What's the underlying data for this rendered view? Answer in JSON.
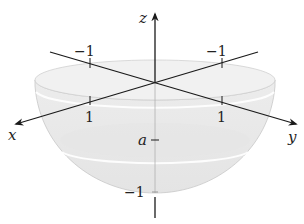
{
  "figure": {
    "type": "3d-hemisphere-diagram",
    "axes": {
      "x": {
        "label": "x",
        "ticks": [
          "-1",
          "1"
        ]
      },
      "y": {
        "label": "y",
        "ticks": [
          "-1",
          "1"
        ]
      },
      "z": {
        "label": "z",
        "ticks": [
          "a",
          "-1"
        ]
      }
    },
    "labels": {
      "x_axis": "x",
      "y_axis": "y",
      "z_axis": "z",
      "x_neg_one": "−1",
      "x_pos_one": "1",
      "y_neg_one": "−1",
      "y_pos_one": "1",
      "z_a": "a",
      "z_neg_one": "−1"
    },
    "colors": {
      "axis": "#1a1a1a",
      "surface_fill": "#e9e9e9",
      "surface_edge": "#c8c8c8",
      "top_disk": "#f1f1f1",
      "band_highlight": "#ffffff"
    }
  }
}
